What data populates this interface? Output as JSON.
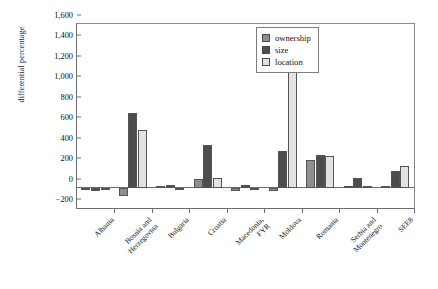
{
  "chart_data": {
    "type": "bar",
    "title": "",
    "xlabel": "",
    "ylabel": "differential percentage",
    "ylim": [
      -200,
      1600
    ],
    "ytick_step": 200,
    "grid": false,
    "legend_position": "upper-right-inside",
    "categories": [
      "Albania",
      "Bosnia and\nHerzegovina",
      "Bulgaria",
      "Croatia",
      "Macedonia,\nFYR",
      "Moldova",
      "Romania",
      "Serbia and\nMontenegro",
      "SEE8"
    ],
    "ytick_labels": [
      "-200",
      "0",
      "200",
      "400",
      "600",
      "800",
      "1,000",
      "1,200",
      "1,400",
      "1,600"
    ],
    "series": [
      {
        "name": "ownership",
        "color": "#8f8f8f",
        "values": [
          -20,
          -80,
          5,
          85,
          -35,
          -30,
          270,
          8,
          10
        ]
      },
      {
        "name": "size",
        "color": "#4d4d4d",
        "values": [
          -30,
          730,
          30,
          415,
          30,
          360,
          320,
          90,
          165
        ]
      },
      {
        "name": "location",
        "color": "#e2e2e2",
        "values": [
          -25,
          560,
          -20,
          90,
          -20,
          1300,
          305,
          15,
          210
        ]
      }
    ]
  },
  "legend": {
    "items": [
      {
        "label": "ownership"
      },
      {
        "label": "size"
      },
      {
        "label": "location"
      }
    ]
  }
}
